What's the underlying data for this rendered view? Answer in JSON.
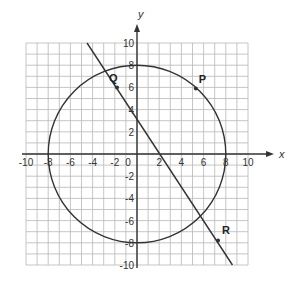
{
  "chart_data": {
    "type": "diagram",
    "title": "",
    "xlabel": "x",
    "ylabel": "y",
    "xlim": [
      -10,
      10
    ],
    "ylim": [
      -10,
      10
    ],
    "grid": true,
    "grid_step": 1,
    "x_tick_labels": [
      "-10",
      "-8",
      "-6",
      "-4",
      "-2",
      "0",
      "2",
      "4",
      "6",
      "8",
      "10"
    ],
    "y_tick_labels": [
      "10",
      "8",
      "6",
      "4",
      "2",
      "-2",
      "-4",
      "-6",
      "-8",
      "-10"
    ],
    "circle": {
      "center": [
        0,
        0
      ],
      "radius": 8
    },
    "line": {
      "from": [
        -4.5,
        10
      ],
      "to": [
        8.6,
        -10
      ]
    },
    "points": [
      {
        "label": "Q",
        "x": -1.8,
        "y": 6
      },
      {
        "label": "P",
        "x": 5.3,
        "y": 5.9
      },
      {
        "label": "R",
        "x": 7.3,
        "y": -7.8
      }
    ]
  },
  "labels": {
    "x_axis": "x",
    "y_axis": "y",
    "point_q": "Q",
    "point_p": "P",
    "point_r": "R"
  },
  "colors": {
    "grid": "#b8b8b8",
    "axis": "#333333",
    "curve": "#333333"
  }
}
